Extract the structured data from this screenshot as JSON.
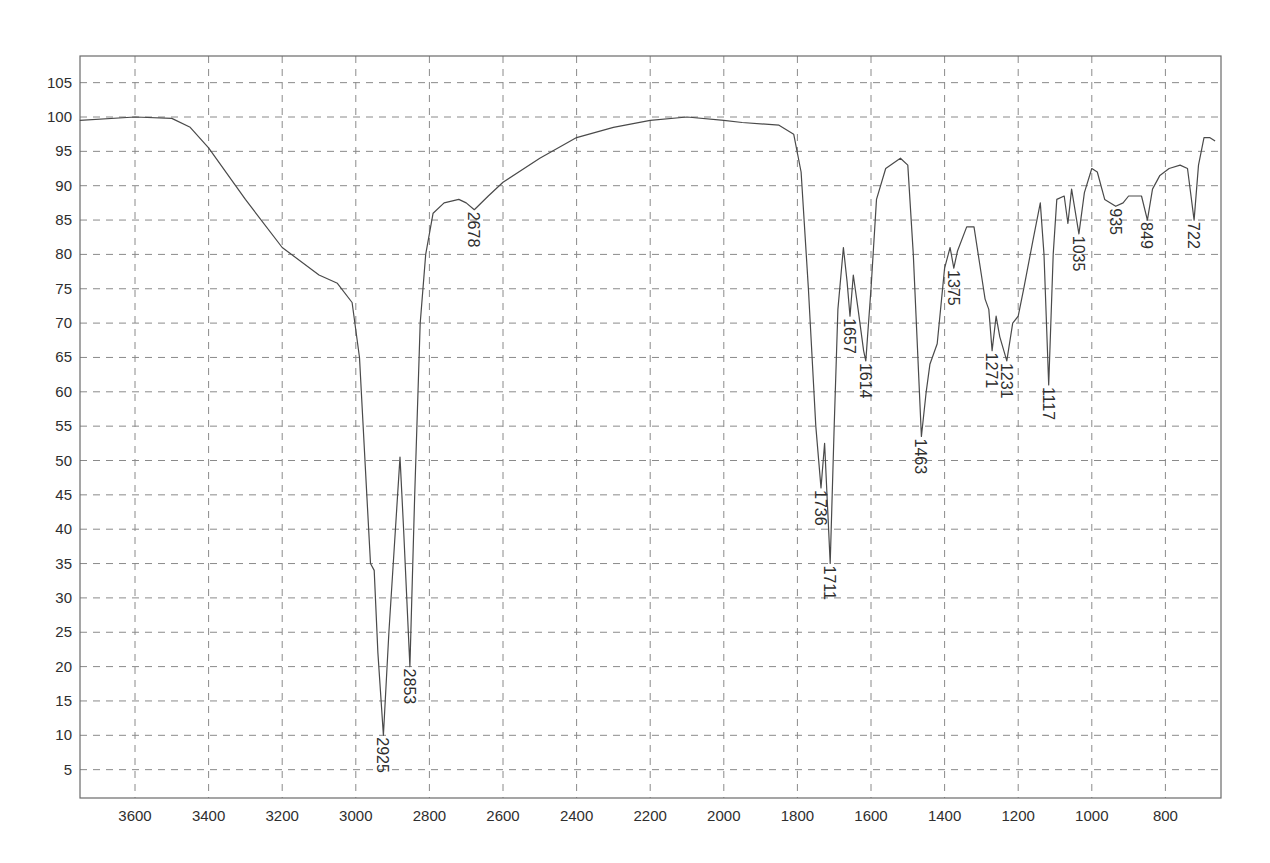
{
  "chart_data": {
    "type": "line",
    "title": "",
    "xlabel": "",
    "ylabel": "",
    "x_reversed": true,
    "xlim": [
      3750,
      660
    ],
    "ylim": [
      1,
      108
    ],
    "grid": true,
    "legend": null,
    "x_ticks": [
      3600,
      3400,
      3200,
      3000,
      2800,
      2600,
      2400,
      2200,
      2000,
      1800,
      1600,
      1400,
      1200,
      1000,
      800
    ],
    "y_ticks": [
      5,
      10,
      15,
      20,
      25,
      30,
      35,
      40,
      45,
      50,
      55,
      60,
      65,
      70,
      75,
      80,
      85,
      90,
      95,
      100,
      105
    ],
    "series": [
      {
        "name": "IR spectrum (%T)",
        "x": [
          3750,
          3600,
          3500,
          3450,
          3400,
          3300,
          3200,
          3100,
          3050,
          3010,
          2990,
          2970,
          2960,
          2950,
          2940,
          2925,
          2910,
          2880,
          2870,
          2853,
          2840,
          2825,
          2810,
          2790,
          2760,
          2720,
          2700,
          2678,
          2640,
          2600,
          2500,
          2400,
          2300,
          2200,
          2100,
          2000,
          1950,
          1850,
          1810,
          1790,
          1770,
          1750,
          1736,
          1726,
          1711,
          1700,
          1690,
          1675,
          1665,
          1657,
          1648,
          1635,
          1620,
          1614,
          1600,
          1585,
          1560,
          1520,
          1500,
          1485,
          1470,
          1463,
          1450,
          1440,
          1420,
          1400,
          1385,
          1375,
          1365,
          1340,
          1320,
          1300,
          1290,
          1280,
          1271,
          1260,
          1250,
          1231,
          1215,
          1200,
          1185,
          1160,
          1140,
          1130,
          1117,
          1105,
          1095,
          1075,
          1065,
          1055,
          1035,
          1020,
          1000,
          985,
          965,
          935,
          915,
          900,
          880,
          865,
          849,
          835,
          815,
          790,
          760,
          740,
          722,
          710,
          695,
          680,
          665
        ],
        "values": [
          99.5,
          100,
          99.8,
          98.5,
          95.5,
          88,
          81,
          77,
          75.8,
          73,
          65,
          45,
          35,
          34,
          22,
          10,
          25,
          50.5,
          40,
          20,
          45,
          70,
          80,
          86,
          87.5,
          88,
          87.5,
          86.5,
          88.5,
          90.5,
          94,
          97,
          98.5,
          99.5,
          100,
          99.5,
          99.2,
          98.8,
          97.5,
          92,
          75,
          55,
          46,
          52.5,
          35,
          55,
          72,
          81,
          76,
          71,
          77,
          72,
          66,
          64.5,
          75,
          88,
          92.5,
          94,
          93,
          80,
          62,
          53.5,
          60,
          64,
          67,
          78,
          81,
          78,
          80.5,
          84,
          84,
          77,
          73.5,
          72,
          66,
          71,
          68,
          64.5,
          70,
          71,
          75,
          82,
          87.5,
          80,
          61,
          80,
          88,
          88.5,
          84.5,
          89.5,
          83,
          89,
          92.5,
          92,
          88,
          87,
          87.5,
          88.5,
          88.5,
          88.5,
          85,
          89.5,
          91.5,
          92.5,
          93,
          92.5,
          85,
          93,
          97,
          97,
          96.5
        ]
      }
    ],
    "annotations": [
      {
        "label": "2925",
        "x": 2925,
        "y": 10
      },
      {
        "label": "2853",
        "x": 2853,
        "y": 20
      },
      {
        "label": "2678",
        "x": 2678,
        "y": 86.5
      },
      {
        "label": "1736",
        "x": 1736,
        "y": 46
      },
      {
        "label": "1711",
        "x": 1711,
        "y": 35
      },
      {
        "label": "1657",
        "x": 1657,
        "y": 71
      },
      {
        "label": "1614",
        "x": 1614,
        "y": 64.5
      },
      {
        "label": "1463",
        "x": 1463,
        "y": 53.5
      },
      {
        "label": "1375",
        "x": 1375,
        "y": 78
      },
      {
        "label": "1271",
        "x": 1271,
        "y": 66
      },
      {
        "label": "1231",
        "x": 1231,
        "y": 64.5
      },
      {
        "label": "1117",
        "x": 1117,
        "y": 61
      },
      {
        "label": "1035",
        "x": 1035,
        "y": 83
      },
      {
        "label": "935",
        "x": 935,
        "y": 87
      },
      {
        "label": "849",
        "x": 849,
        "y": 85
      },
      {
        "label": "722",
        "x": 722,
        "y": 85
      }
    ]
  },
  "colors": {
    "line": "#4a4a4a",
    "grid": "#8a8a8a",
    "frame": "#6a6a6a",
    "text": "#2e2e2e",
    "background": "#ffffff"
  }
}
